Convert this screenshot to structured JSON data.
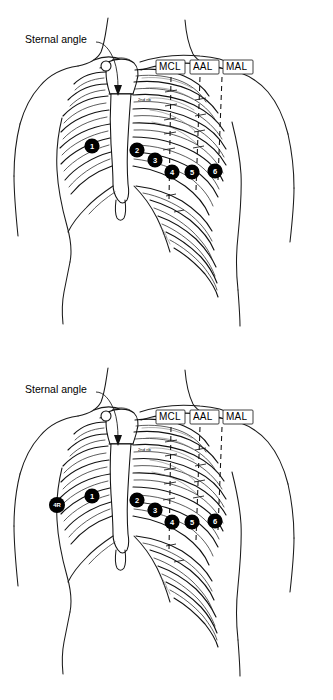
{
  "document": {
    "title": "Anterior chest wall landmarks",
    "panel_count": 2
  },
  "panels": [
    {
      "id": "panel-top",
      "name": "anterior-chest-panel-upper",
      "annotations": {
        "sternal_angle_label": "Sternal angle",
        "second_rib_label": "2nd rib"
      },
      "vertical_lines": [
        {
          "abbr": "MCL",
          "full": "midclavicular line"
        },
        {
          "abbr": "AAL",
          "full": "anterior axillary line"
        },
        {
          "abbr": "MAL",
          "full": "midaxillary line"
        }
      ],
      "markers": [
        {
          "label": "1"
        },
        {
          "label": "2"
        },
        {
          "label": "3"
        },
        {
          "label": "4"
        },
        {
          "label": "5"
        },
        {
          "label": "6"
        }
      ]
    },
    {
      "id": "panel-bottom",
      "name": "anterior-chest-panel-lower",
      "annotations": {
        "sternal_angle_label": "Sternal angle",
        "second_rib_label": "2nd rib"
      },
      "vertical_lines": [
        {
          "abbr": "MCL",
          "full": "midclavicular line"
        },
        {
          "abbr": "AAL",
          "full": "anterior axillary line"
        },
        {
          "abbr": "MAL",
          "full": "midaxillary line"
        }
      ],
      "markers": [
        {
          "label": "1"
        },
        {
          "label": "2"
        },
        {
          "label": "3"
        },
        {
          "label": "4"
        },
        {
          "label": "5"
        },
        {
          "label": "6"
        },
        {
          "label": "4R"
        }
      ]
    }
  ],
  "colors": {
    "ink": "#111111",
    "marker_fill": "#000000",
    "marker_text": "#ffffff",
    "background": "#ffffff"
  }
}
